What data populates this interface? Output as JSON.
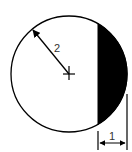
{
  "diagram": {
    "type": "circular-segment-geometry",
    "circle": {
      "center": [
        69,
        74
      ],
      "radius": 58,
      "stroke": "#000000",
      "fill": "#ffffff"
    },
    "shaded_segment": {
      "fill": "#000000",
      "chord_x": 98
    },
    "radius_label": "2",
    "width_label": "1",
    "center_mark": "cross",
    "colors": {
      "line": "#000000",
      "segment": "#000000",
      "background": "#ffffff",
      "text": "#333333"
    }
  }
}
